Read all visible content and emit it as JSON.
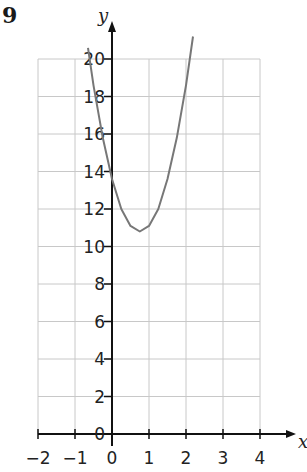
{
  "question_number": "9",
  "chart_data": {
    "type": "line",
    "title": "",
    "xlabel": "x",
    "ylabel": "y",
    "xlim": [
      -2,
      4
    ],
    "ylim": [
      0,
      20
    ],
    "x_ticks": [
      -2,
      -1,
      0,
      1,
      2,
      3,
      4
    ],
    "x_tick_labels": [
      "−2",
      "−1",
      "0",
      "1",
      "2",
      "3",
      "4"
    ],
    "y_ticks": [
      0,
      2,
      4,
      6,
      8,
      10,
      12,
      14,
      16,
      18,
      20
    ],
    "y_tick_labels": [
      "0",
      "2",
      "4",
      "6",
      "8",
      "10",
      "12",
      "14",
      "16",
      "18",
      "20"
    ],
    "grid": true,
    "grid_x_step": 1,
    "grid_y_step": 2,
    "legend": null,
    "series": [
      {
        "name": "quadratic curve",
        "description": "Parabola opening upward, minimum near (0.75, 10.8), y-intercept about 13",
        "x": [
          -0.65,
          -0.5,
          -0.25,
          0,
          0.25,
          0.5,
          0.75,
          1.0,
          1.25,
          1.5,
          1.75,
          2.0,
          2.19
        ],
        "y": [
          20.6,
          18.6,
          15.8,
          13.6,
          12.0,
          11.1,
          10.8,
          11.1,
          12.0,
          13.6,
          15.8,
          18.6,
          21.2
        ]
      }
    ],
    "colors": {
      "axis": "#111111",
      "grid": "#c8c8c8",
      "curve": "#777777",
      "text": "#222222"
    }
  }
}
